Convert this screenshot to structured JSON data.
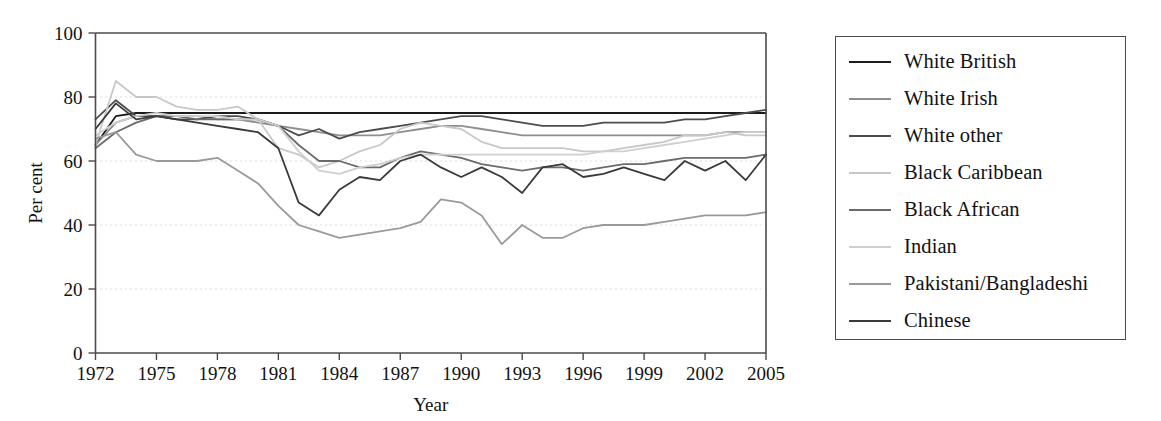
{
  "chart_data": {
    "type": "line",
    "title": "",
    "xlabel": "Year",
    "ylabel": "Per cent",
    "xlim": [
      1972,
      2005
    ],
    "ylim": [
      0,
      100
    ],
    "xticks": [
      1972,
      1975,
      1978,
      1981,
      1984,
      1987,
      1990,
      1993,
      1996,
      1999,
      2002,
      2005
    ],
    "yticks": [
      0,
      20,
      40,
      60,
      80,
      100
    ],
    "grid": "horizontal-dotted",
    "legend_position": "right-outside",
    "x": [
      1972,
      1973,
      1974,
      1975,
      1976,
      1977,
      1978,
      1979,
      1980,
      1981,
      1982,
      1983,
      1984,
      1985,
      1986,
      1987,
      1988,
      1989,
      1990,
      1991,
      1992,
      1993,
      1994,
      1995,
      1996,
      1997,
      1998,
      1999,
      2000,
      2001,
      2002,
      2003,
      2004,
      2005
    ],
    "series": [
      {
        "name": "White British",
        "color": "#1c1c1c",
        "values": [
          65,
          74,
          75,
          75,
          75,
          75,
          75,
          75,
          75,
          75,
          75,
          75,
          75,
          75,
          75,
          75,
          75,
          75,
          75,
          75,
          75,
          75,
          75,
          75,
          75,
          75,
          75,
          75,
          75,
          75,
          75,
          75,
          75,
          75
        ]
      },
      {
        "name": "White Irish",
        "color": "#8e8e8e",
        "values": [
          65,
          72,
          74,
          74,
          74,
          74,
          73,
          73,
          72,
          71,
          70,
          69,
          68,
          68,
          68,
          69,
          70,
          71,
          71,
          70,
          69,
          68,
          68,
          68,
          68,
          68,
          68,
          68,
          68,
          68,
          68,
          69,
          69,
          69
        ]
      },
      {
        "name": "White other",
        "color": "#4d4d4d",
        "values": [
          73,
          79,
          74,
          74,
          73,
          73,
          74,
          74,
          73,
          71,
          68,
          70,
          67,
          69,
          70,
          71,
          72,
          73,
          74,
          74,
          73,
          72,
          71,
          71,
          71,
          72,
          72,
          72,
          72,
          73,
          73,
          74,
          75,
          76
        ]
      },
      {
        "name": "Black Caribbean",
        "color": "#c8c8c8",
        "values": [
          65,
          85,
          80,
          80,
          77,
          76,
          76,
          77,
          73,
          64,
          62,
          58,
          60,
          63,
          65,
          70,
          72,
          71,
          70,
          66,
          64,
          64,
          64,
          64,
          63,
          63,
          64,
          65,
          66,
          68,
          68,
          69,
          68,
          68
        ]
      },
      {
        "name": "Black African",
        "color": "#6b6b6b",
        "values": [
          64,
          69,
          72,
          74,
          74,
          73,
          73,
          73,
          73,
          71,
          65,
          60,
          60,
          58,
          58,
          61,
          63,
          62,
          61,
          59,
          58,
          57,
          58,
          58,
          57,
          58,
          59,
          59,
          60,
          61,
          61,
          61,
          61,
          62
        ]
      },
      {
        "name": "Indian",
        "color": "#cfcfcf",
        "values": [
          68,
          72,
          74,
          75,
          74,
          74,
          74,
          73,
          73,
          71,
          63,
          57,
          56,
          58,
          59,
          61,
          62,
          62,
          62,
          62,
          62,
          62,
          62,
          62,
          62,
          63,
          63,
          64,
          65,
          66,
          67,
          68,
          69,
          69
        ]
      },
      {
        "name": "Pakistani/Bangladeshi",
        "color": "#9a9a9a",
        "values": [
          67,
          69,
          62,
          60,
          60,
          60,
          61,
          57,
          53,
          46,
          40,
          38,
          36,
          37,
          38,
          39,
          41,
          48,
          47,
          43,
          34,
          40,
          36,
          36,
          39,
          40,
          40,
          40,
          41,
          42,
          43,
          43,
          43,
          44
        ]
      },
      {
        "name": "Chinese",
        "color": "#3a3a3a",
        "values": [
          70,
          78,
          73,
          74,
          73,
          72,
          71,
          70,
          69,
          64,
          47,
          43,
          51,
          55,
          54,
          60,
          62,
          58,
          55,
          58,
          55,
          50,
          58,
          59,
          55,
          56,
          58,
          56,
          54,
          60,
          57,
          60,
          54,
          62
        ]
      }
    ]
  },
  "legend": {
    "items": [
      {
        "label": "White British"
      },
      {
        "label": "White Irish"
      },
      {
        "label": "White other"
      },
      {
        "label": "Black Caribbean"
      },
      {
        "label": "Black African"
      },
      {
        "label": "Indian"
      },
      {
        "label": "Pakistani/Bangladeshi"
      },
      {
        "label": "Chinese"
      }
    ]
  }
}
